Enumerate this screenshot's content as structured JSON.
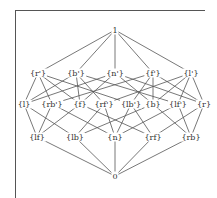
{
  "diagram": {
    "type": "hasse-lattice",
    "colors": {
      "line": "#555555",
      "text": "#333333",
      "background": "#ffffff"
    },
    "nodes": [
      {
        "id": "top",
        "label": "1",
        "x": 115,
        "y": 30
      },
      {
        "id": "r_c",
        "label": "{r'}",
        "x": 38,
        "y": 73
      },
      {
        "id": "b_c",
        "label": "{b'}",
        "x": 76,
        "y": 73
      },
      {
        "id": "n_c",
        "label": "{n'}",
        "x": 115,
        "y": 73
      },
      {
        "id": "f_c",
        "label": "{f'}",
        "x": 153,
        "y": 73
      },
      {
        "id": "l_c",
        "label": "{l'}",
        "x": 191,
        "y": 73
      },
      {
        "id": "l",
        "label": "{l}",
        "x": 24,
        "y": 104
      },
      {
        "id": "rb_c",
        "label": "{rb'}",
        "x": 52,
        "y": 104
      },
      {
        "id": "f",
        "label": "{f}",
        "x": 80,
        "y": 104
      },
      {
        "id": "rf_c",
        "label": "{rf'}",
        "x": 104,
        "y": 104
      },
      {
        "id": "lb_c",
        "label": "{lb'}",
        "x": 131,
        "y": 104
      },
      {
        "id": "b",
        "label": "{b}",
        "x": 153,
        "y": 104
      },
      {
        "id": "lf_c",
        "label": "{lf'}",
        "x": 178,
        "y": 104
      },
      {
        "id": "r",
        "label": "{r}",
        "x": 204,
        "y": 104
      },
      {
        "id": "lf",
        "label": "{lf}",
        "x": 37,
        "y": 137
      },
      {
        "id": "lb",
        "label": "{lb}",
        "x": 75,
        "y": 137
      },
      {
        "id": "n",
        "label": "{n}",
        "x": 115,
        "y": 137
      },
      {
        "id": "rf",
        "label": "{rf}",
        "x": 153,
        "y": 137
      },
      {
        "id": "rb",
        "label": "{rb}",
        "x": 191,
        "y": 137
      },
      {
        "id": "bottom",
        "label": "0",
        "x": 115,
        "y": 176
      }
    ],
    "edges": [
      [
        "top",
        "r_c"
      ],
      [
        "top",
        "b_c"
      ],
      [
        "top",
        "n_c"
      ],
      [
        "top",
        "f_c"
      ],
      [
        "top",
        "l_c"
      ],
      [
        "r_c",
        "l"
      ],
      [
        "r_c",
        "rb_c"
      ],
      [
        "r_c",
        "lb_c"
      ],
      [
        "r_c",
        "f"
      ],
      [
        "b_c",
        "l"
      ],
      [
        "b_c",
        "f"
      ],
      [
        "b_c",
        "rf_c"
      ],
      [
        "b_c",
        "lf_c"
      ],
      [
        "n_c",
        "f"
      ],
      [
        "n_c",
        "b"
      ],
      [
        "n_c",
        "l"
      ],
      [
        "n_c",
        "r"
      ],
      [
        "f_c",
        "b"
      ],
      [
        "f_c",
        "r"
      ],
      [
        "f_c",
        "rb_c"
      ],
      [
        "f_c",
        "lb_c"
      ],
      [
        "l_c",
        "r"
      ],
      [
        "l_c",
        "lf_c"
      ],
      [
        "l_c",
        "rf_c"
      ],
      [
        "l_c",
        "b"
      ],
      [
        "l",
        "lf"
      ],
      [
        "l",
        "lb"
      ],
      [
        "rb_c",
        "lf"
      ],
      [
        "rb_c",
        "n"
      ],
      [
        "f",
        "lf"
      ],
      [
        "f",
        "rf"
      ],
      [
        "rf_c",
        "lb"
      ],
      [
        "rf_c",
        "n"
      ],
      [
        "lb_c",
        "rf"
      ],
      [
        "lb_c",
        "n"
      ],
      [
        "b",
        "lb"
      ],
      [
        "b",
        "rb"
      ],
      [
        "lf_c",
        "rb"
      ],
      [
        "lf_c",
        "n"
      ],
      [
        "r",
        "rf"
      ],
      [
        "r",
        "rb"
      ],
      [
        "lf",
        "bottom"
      ],
      [
        "lb",
        "bottom"
      ],
      [
        "n",
        "bottom"
      ],
      [
        "rf",
        "bottom"
      ],
      [
        "rb",
        "bottom"
      ]
    ]
  }
}
